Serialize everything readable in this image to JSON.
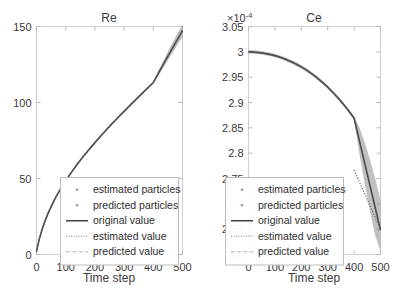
{
  "figure": {
    "width": 393,
    "height": 292,
    "background": "#ffffff",
    "axis_color": "#cfcfcf",
    "curve_color": "#4a4a4a",
    "band_color": "#8c8c8c"
  },
  "chart_data": [
    {
      "type": "line",
      "title": "Re",
      "xlabel": "Time step",
      "ylabel": "",
      "xlim": [
        0,
        500
      ],
      "ylim": [
        0,
        150
      ],
      "xticks": [
        0,
        100,
        200,
        300,
        400,
        500
      ],
      "xtick_labels": [
        "0",
        "100",
        "200",
        "300",
        "400",
        "500"
      ],
      "yticks": [
        0,
        50,
        100,
        150
      ],
      "ytick_labels": [
        "0",
        "50",
        "100",
        "150"
      ],
      "y_multiplier": "",
      "grid": false,
      "legend_position": "lower-center-right",
      "legend": [
        "estimated particles",
        "predicted particles",
        "original value",
        "estimated value",
        "predicted value"
      ],
      "x": [
        0,
        10,
        20,
        30,
        40,
        50,
        60,
        70,
        80,
        90,
        100,
        120,
        140,
        160,
        180,
        200,
        220,
        240,
        260,
        280,
        300,
        320,
        340,
        360,
        380,
        400,
        420,
        440,
        460,
        480,
        500
      ],
      "series": [
        {
          "name": "original value",
          "values": [
            2.0,
            10.5,
            17.0,
            22.5,
            27.2,
            31.5,
            35.4,
            39.0,
            42.3,
            45.5,
            48.5,
            54.2,
            59.5,
            64.4,
            69.1,
            73.6,
            78.0,
            82.2,
            86.3,
            90.3,
            94.2,
            98.1,
            101.9,
            105.7,
            109.4,
            113.1,
            120.1,
            127.0,
            133.8,
            140.5,
            147.2
          ]
        },
        {
          "name": "estimated value",
          "values": [
            2.0,
            10.4,
            16.9,
            22.4,
            27.1,
            31.4,
            35.3,
            38.9,
            42.2,
            45.4,
            48.4,
            54.1,
            59.4,
            64.3,
            69.0,
            73.5,
            77.9,
            82.1,
            86.2,
            90.2,
            94.1,
            98.0,
            101.8,
            105.6,
            109.3,
            113.0,
            null,
            null,
            null,
            null,
            null
          ]
        },
        {
          "name": "predicted value",
          "values": [
            null,
            null,
            null,
            null,
            null,
            null,
            null,
            null,
            null,
            null,
            null,
            null,
            null,
            null,
            null,
            null,
            null,
            null,
            null,
            null,
            null,
            null,
            null,
            null,
            null,
            113.0,
            120.3,
            127.3,
            134.2,
            141.0,
            147.8
          ]
        }
      ],
      "uncertainty_band": {
        "description": "particle spread around the trajectory; narrow before step 400, widening after",
        "lower": [
          1.2,
          9.8,
          16.3,
          21.8,
          26.5,
          30.8,
          34.7,
          38.3,
          41.6,
          44.8,
          47.8,
          53.5,
          58.8,
          63.7,
          68.4,
          72.9,
          77.3,
          81.5,
          85.6,
          89.6,
          93.5,
          97.4,
          101.2,
          105.0,
          108.7,
          112.4,
          118.4,
          124.6,
          130.8,
          137.0,
          143.2
        ],
        "upper": [
          2.8,
          11.2,
          17.7,
          23.2,
          27.9,
          32.2,
          36.1,
          39.7,
          43.0,
          46.2,
          49.2,
          54.9,
          60.2,
          65.1,
          69.8,
          74.3,
          78.7,
          82.9,
          87.0,
          91.0,
          94.9,
          98.8,
          102.6,
          106.4,
          110.1,
          113.8,
          121.8,
          129.6,
          137.2,
          144.6,
          151.5
        ]
      }
    },
    {
      "type": "line",
      "title": "Ce",
      "xlabel": "Time step",
      "ylabel": "",
      "xlim": [
        0,
        500
      ],
      "ylim": [
        2.6,
        3.05
      ],
      "xticks": [
        0,
        100,
        200,
        300,
        400,
        500
      ],
      "xtick_labels": [
        "0",
        "100",
        "200",
        "300",
        "400",
        "500"
      ],
      "yticks": [
        2.6,
        2.65,
        2.7,
        2.75,
        2.8,
        2.85,
        2.9,
        2.95,
        3.0,
        3.05
      ],
      "ytick_labels": [
        "2.6",
        "2.65",
        "2.7",
        "2.75",
        "2.8",
        "2.85",
        "2.9",
        "2.95",
        "3",
        "3.05"
      ],
      "y_multiplier": "×10",
      "y_multiplier_exponent": "-4",
      "grid": false,
      "legend_position": "lower-left-center",
      "legend": [
        "estimated particles",
        "predicted particles",
        "original value",
        "estimated value",
        "predicted value"
      ],
      "x": [
        0,
        20,
        40,
        60,
        80,
        100,
        120,
        140,
        160,
        180,
        200,
        220,
        240,
        260,
        280,
        300,
        320,
        340,
        360,
        380,
        400,
        420,
        440,
        460,
        480,
        500
      ],
      "series": [
        {
          "name": "original value",
          "values": [
            3.0,
            2.9995,
            2.9985,
            2.997,
            2.995,
            2.9925,
            2.9892,
            2.9855,
            2.981,
            2.976,
            2.9702,
            2.9638,
            2.9565,
            2.9485,
            2.9398,
            2.9302,
            2.9198,
            2.9085,
            2.8962,
            2.8832,
            2.869,
            2.8248,
            2.7806,
            2.7364,
            2.6922,
            2.648
          ]
        },
        {
          "name": "estimated value",
          "values": [
            3.0,
            2.9994,
            2.9984,
            2.9969,
            2.9949,
            2.9924,
            2.9891,
            2.9854,
            2.9809,
            2.9759,
            2.9701,
            2.9637,
            2.9564,
            2.9484,
            2.9397,
            2.9301,
            2.9197,
            2.9084,
            2.8961,
            2.8831,
            2.8689,
            null,
            null,
            null,
            null,
            null
          ]
        },
        {
          "name": "predicted value",
          "values": [
            null,
            null,
            null,
            null,
            null,
            null,
            null,
            null,
            null,
            null,
            null,
            null,
            null,
            null,
            null,
            null,
            null,
            null,
            null,
            null,
            2.7665,
            2.7432,
            2.7198,
            2.6965,
            2.6732,
            2.6499
          ]
        }
      ],
      "uncertainty_band": {
        "description": "particle spread; tight through step 400 then fanning out strongly to step 500",
        "lower": [
          2.9965,
          2.996,
          2.995,
          2.9936,
          2.9916,
          2.9891,
          2.9858,
          2.9821,
          2.9776,
          2.9726,
          2.9668,
          2.9604,
          2.9531,
          2.9451,
          2.9364,
          2.9268,
          2.9164,
          2.9051,
          2.8928,
          2.8798,
          2.8656,
          2.7985,
          2.7395,
          2.6855,
          2.6365,
          2.6065
        ],
        "upper": [
          3.0035,
          3.003,
          3.002,
          3.0006,
          2.9986,
          2.9961,
          2.9928,
          2.9891,
          2.9846,
          2.9796,
          2.9738,
          2.9674,
          2.9601,
          2.9521,
          2.9434,
          2.9338,
          2.9234,
          2.9121,
          2.8998,
          2.8868,
          2.8726,
          2.8508,
          2.8215,
          2.7875,
          2.7495,
          2.7075
        ]
      }
    }
  ]
}
